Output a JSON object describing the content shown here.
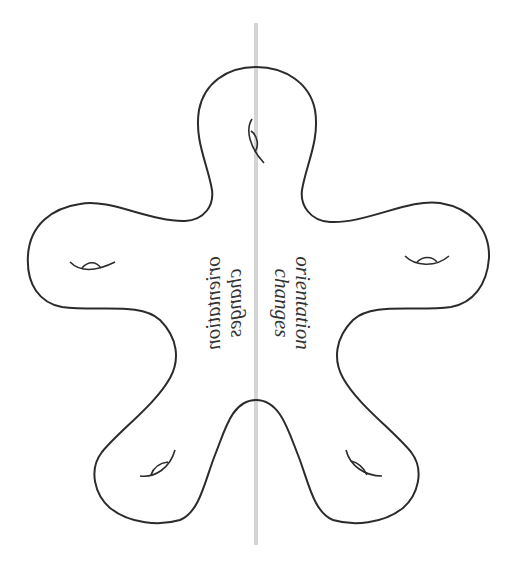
{
  "diagram": {
    "labels": {
      "right": {
        "line1": "orientation",
        "line2": "changes"
      },
      "left_mirrored": {
        "line1": "orientation",
        "line2": "changes"
      }
    },
    "colors": {
      "outline": "#2b2b2b",
      "mirror_line": "#d4d4d4",
      "text": "#333333",
      "background": "#ffffff"
    },
    "elements": {
      "mirror_line": "vertical-axis-line",
      "surface": "five-armed-surface-outline",
      "handles": [
        "top-handle",
        "left-handle",
        "right-handle",
        "bottom-left-handle",
        "bottom-right-handle"
      ]
    }
  }
}
